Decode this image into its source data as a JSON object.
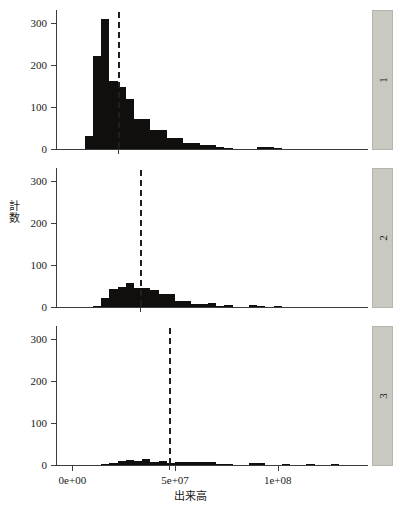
{
  "caption": "",
  "axes": {
    "ylabel_chars": [
      "計",
      "数"
    ],
    "ylabel": "計数",
    "xlabel": "出来高",
    "y_ticks": [
      "0",
      "100",
      "200",
      "300"
    ],
    "y_tick_values": [
      0,
      100,
      200,
      300
    ],
    "x_ticks": [
      "0e+00",
      "5e+07",
      "1e+08"
    ],
    "x_tick_values": [
      0,
      50000000,
      100000000
    ]
  },
  "strips": [
    {
      "label": "1"
    },
    {
      "label": "2"
    },
    {
      "label": "3"
    }
  ],
  "colors": {
    "bar": "#100f0d",
    "axis": "#3c3c3a",
    "strip_fill": "#c9c9c2",
    "strip_border": "#b5b5ae",
    "refline": "#201f1c",
    "background": "#ffffff"
  },
  "chart_data": {
    "type": "bar",
    "subtype": "faceted-histogram",
    "title": "",
    "xlabel": "出来高",
    "ylabel": "計数",
    "xlim": [
      -8000000,
      144000000
    ],
    "ylim": [
      0,
      330
    ],
    "grid": false,
    "legend": "none",
    "bin_width": 4000000,
    "panels": [
      {
        "name": "1",
        "reference_line": 22000000,
        "bin_starts": [
          6000000,
          10000000,
          14000000,
          18000000,
          22000000,
          26000000,
          30000000,
          34000000,
          38000000,
          42000000,
          46000000,
          50000000,
          54000000,
          58000000,
          62000000,
          66000000,
          70000000,
          74000000,
          90000000,
          94000000,
          98000000
        ],
        "values": [
          30,
          222,
          308,
          162,
          147,
          118,
          72,
          72,
          45,
          45,
          26,
          26,
          14,
          14,
          9,
          9,
          5,
          3,
          5,
          5,
          2
        ]
      },
      {
        "name": "2",
        "reference_line": 33000000,
        "bin_starts": [
          10000000,
          14000000,
          18000000,
          22000000,
          26000000,
          30000000,
          34000000,
          38000000,
          42000000,
          46000000,
          50000000,
          54000000,
          58000000,
          62000000,
          66000000,
          70000000,
          74000000,
          86000000,
          90000000,
          98000000
        ],
        "values": [
          3,
          22,
          42,
          48,
          56,
          44,
          44,
          40,
          32,
          32,
          14,
          14,
          6,
          6,
          9,
          3,
          4,
          4,
          2,
          2
        ]
      },
      {
        "name": "3",
        "reference_line": 47000000,
        "bin_starts": [
          14000000,
          18000000,
          22000000,
          26000000,
          30000000,
          34000000,
          38000000,
          42000000,
          46000000,
          50000000,
          54000000,
          58000000,
          62000000,
          66000000,
          70000000,
          74000000,
          86000000,
          90000000,
          102000000,
          114000000,
          126000000
        ],
        "values": [
          3,
          5,
          9,
          12,
          10,
          15,
          8,
          9,
          4,
          8,
          7,
          6,
          6,
          6,
          3,
          2,
          4,
          4,
          2,
          2,
          2
        ]
      }
    ]
  }
}
